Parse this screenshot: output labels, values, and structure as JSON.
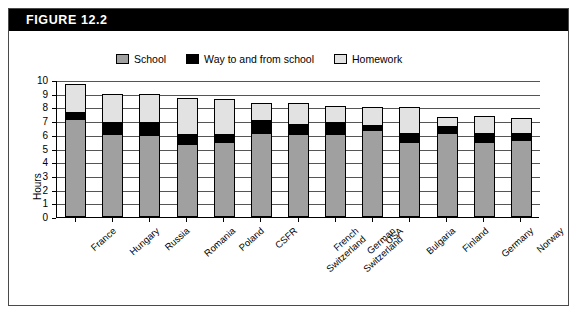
{
  "figure": {
    "header_label": "FIGURE  12.2"
  },
  "legend": {
    "items": [
      {
        "label": "School",
        "color": "#a0a0a0",
        "icon": "square-swatch-icon"
      },
      {
        "label": "Way to and from school",
        "color": "#000000",
        "icon": "square-swatch-icon"
      },
      {
        "label": "Homework",
        "color": "#e2e2e2",
        "icon": "square-swatch-icon"
      }
    ]
  },
  "chart_data": {
    "type": "bar",
    "stacked": true,
    "title": "FIGURE  12.2",
    "xlabel": "",
    "ylabel": "Hours",
    "ylim": [
      0,
      10
    ],
    "yticks": [
      0,
      1,
      2,
      3,
      4,
      5,
      6,
      7,
      8,
      9,
      10
    ],
    "ytick_labels": [
      "0",
      "1",
      "2",
      "3",
      "4",
      "5",
      "6",
      "7",
      "8",
      "9",
      "10"
    ],
    "grid": true,
    "legend_position": "top",
    "categories": [
      "France",
      "Hungary",
      "Russia",
      "Romania",
      "Poland",
      "CSFR",
      "French Switzerland",
      "German Switzerland",
      "USA",
      "Bulgaria",
      "Finland",
      "Germany",
      "Norway"
    ],
    "category_lines": [
      [
        "France"
      ],
      [
        "Hungary"
      ],
      [
        "Russia"
      ],
      [
        "Romania"
      ],
      [
        "Poland"
      ],
      [
        "CSFR"
      ],
      [
        "French",
        "Switzerland"
      ],
      [
        "German",
        "Switzerland"
      ],
      [
        "USA"
      ],
      [
        "Bulgaria"
      ],
      [
        "Finland"
      ],
      [
        "Germany"
      ],
      [
        "Norway"
      ]
    ],
    "series": [
      {
        "name": "School",
        "color": "#a0a0a0",
        "values": [
          7.15,
          6.0,
          5.9,
          5.3,
          5.4,
          6.1,
          6.0,
          6.0,
          6.3,
          5.4,
          6.1,
          5.4,
          5.6
        ]
      },
      {
        "name": "Way to and from school",
        "color": "#000000",
        "values": [
          0.55,
          1.0,
          1.1,
          0.8,
          0.7,
          1.0,
          0.8,
          1.0,
          0.45,
          0.8,
          0.6,
          0.75,
          0.6
        ]
      },
      {
        "name": "Homework",
        "color": "#e2e2e2",
        "values": [
          2.0,
          2.0,
          2.0,
          2.6,
          2.5,
          1.2,
          1.5,
          1.1,
          1.25,
          1.8,
          0.6,
          1.2,
          1.0
        ]
      }
    ],
    "totals": [
      9.7,
      9.0,
      9.0,
      8.7,
      8.6,
      8.3,
      8.3,
      8.1,
      8.0,
      8.0,
      7.3,
      7.35,
      7.2
    ]
  }
}
